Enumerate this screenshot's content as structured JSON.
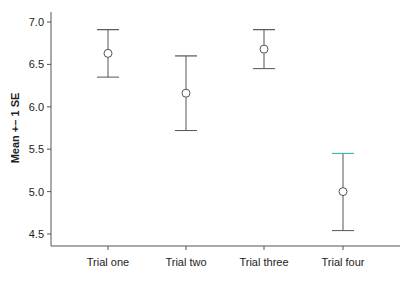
{
  "chart_data": {
    "type": "scatter",
    "subtype": "error-bar",
    "title": "",
    "xlabel": "",
    "ylabel": "Mean +– 1 SE",
    "categories": [
      "Trial one",
      "Trial two",
      "Trial three",
      "Trial four"
    ],
    "series": [
      {
        "name": "Mean",
        "values": [
          6.63,
          6.16,
          6.68,
          5.0
        ],
        "upper": [
          6.91,
          6.6,
          6.91,
          5.45
        ],
        "lower": [
          6.35,
          5.72,
          6.45,
          4.54
        ]
      }
    ],
    "yticks": [
      "4.5",
      "5.0",
      "5.5",
      "6.0",
      "6.5",
      "7.0"
    ],
    "ylim": [
      4.37,
      7.13
    ],
    "grid": false,
    "legend": null,
    "colors": {
      "line": "#555555",
      "highlight_cap": "#3fb8b0"
    }
  }
}
